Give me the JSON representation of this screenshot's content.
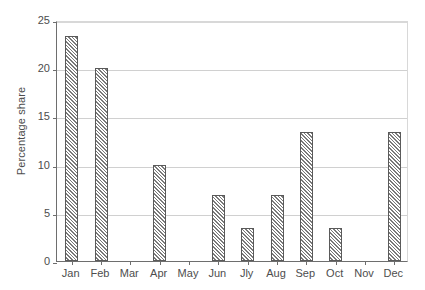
{
  "chart_data": {
    "type": "bar",
    "title": "",
    "xlabel": "",
    "ylabel": "Percentage share",
    "categories": [
      "Jan",
      "Feb",
      "Mar",
      "Apr",
      "May",
      "Jun",
      "Jly",
      "Aug",
      "Sep",
      "Oct",
      "Nov",
      "Dec"
    ],
    "values": [
      23.3,
      20.0,
      0,
      10.0,
      0,
      6.8,
      3.4,
      6.8,
      13.4,
      3.4,
      0,
      13.4
    ],
    "ylim": [
      0,
      25
    ],
    "yticks": [
      0,
      5,
      10,
      15,
      20,
      25
    ],
    "ytick_labels": [
      "0",
      "5",
      "10",
      "15",
      "20",
      "25"
    ],
    "grid": true,
    "legend": false,
    "bar_fill": "hatched-diagonal",
    "bar_edge_color": "#5a5a5a",
    "grid_color": "#d0d0d0",
    "axis_color": "#6e6e6e",
    "text_color": "#4d4d4d",
    "background": "#ffffff"
  }
}
